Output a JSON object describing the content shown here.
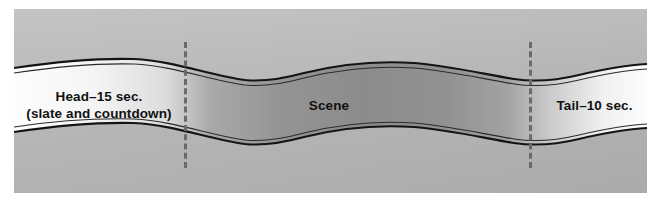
{
  "figure": {
    "title_visible": false,
    "panel": {
      "background_color": "#b9b9b9",
      "band_fill_light": "#f2f2f2",
      "band_fill_dark": "#8e8e8e",
      "outline_color": "#1a1a1a",
      "divider_color": "#6a6a6a"
    },
    "segments": [
      {
        "id": "head",
        "label_line1": "Head–15 sec.",
        "label_line2": "(slate and countdown)",
        "duration_text": "15 sec."
      },
      {
        "id": "scene",
        "label_line1": "Scene",
        "label_line2": "",
        "duration_text": ""
      },
      {
        "id": "tail",
        "label_line1": "Tail–10 sec.",
        "label_line2": "",
        "duration_text": "10 sec."
      }
    ],
    "dividers": [
      {
        "id": "divider-head",
        "after_segment": "head"
      },
      {
        "id": "divider-tail",
        "after_segment": "scene"
      }
    ]
  }
}
